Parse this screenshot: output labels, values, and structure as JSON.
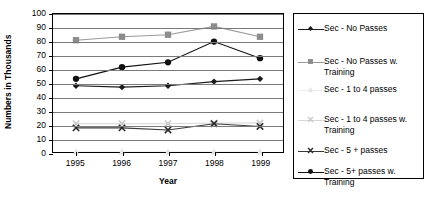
{
  "chart_data": {
    "type": "line",
    "title": "",
    "xlabel": "Year",
    "ylabel": "Numbers in Thousands",
    "categories": [
      "1995",
      "1996",
      "1997",
      "1998",
      "1999"
    ],
    "x": [
      1995,
      1996,
      1997,
      1998,
      1999
    ],
    "ylim": [
      0,
      100
    ],
    "ytick_step": 10,
    "yticks": [
      "100",
      "90",
      "80",
      "70",
      "60",
      "50",
      "40",
      "30",
      "20",
      "10",
      "0"
    ],
    "grid": true,
    "legend_position": "right-outside",
    "series": [
      {
        "name": "Sec - No Passes",
        "marker": "diamond",
        "color": "#1a1a1a",
        "line_color": "#1a1a1a",
        "values": [
          48,
          47,
          48,
          51,
          53
        ]
      },
      {
        "name": "Sec - No Passes w. Training",
        "marker": "square",
        "color": "#8c8c8c",
        "line_color": "#9a9a9a",
        "values": [
          81,
          83.5,
          85,
          91,
          83.5
        ]
      },
      {
        "name": "Sec - 1 to 4 passes",
        "marker": "triangle",
        "color": "#e3e3e3",
        "line_color": "#ededed",
        "values": [
          0.5,
          0.5,
          0.5,
          0.5,
          0.5
        ]
      },
      {
        "name": "Sec - 1 to 4 passes w. Training",
        "marker": "x",
        "color": "#c9c9c9",
        "line_color": "#d6d6d6",
        "values": [
          20.5,
          20.5,
          20.5,
          21,
          21
        ]
      },
      {
        "name": "Sec - 5 + passes",
        "marker": "x",
        "color": "#2b2b2b",
        "line_color": "#3a3a3a",
        "values": [
          17.5,
          17.5,
          16,
          20.5,
          18.5
        ]
      },
      {
        "name": "Sec - 5+ passes w. Training",
        "marker": "circle",
        "color": "#111111",
        "line_color": "#111111",
        "values": [
          53,
          61.5,
          65,
          80,
          68
        ]
      }
    ]
  },
  "legend": {
    "items": [
      {
        "label": "Sec - No Passes"
      },
      {
        "label": "Sec - No Passes w. Training"
      },
      {
        "label": "Sec - 1 to 4 passes"
      },
      {
        "label": "Sec - 1 to 4 passes w. Training"
      },
      {
        "label": "Sec - 5 + passes"
      },
      {
        "label": "Sec - 5+ passes w. Training"
      }
    ]
  },
  "axes": {
    "y_title": "Numbers in Thousands",
    "x_title": "Year"
  },
  "colors": {
    "grid": "#7a7a7a",
    "frame": "#000000",
    "background": "#ffffff"
  }
}
